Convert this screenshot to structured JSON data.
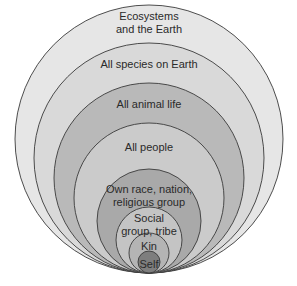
{
  "diagram": {
    "type": "nested-circles",
    "rings": [
      {
        "label_lines": [
          "Ecosystems",
          "and the Earth"
        ],
        "fill": "#e6e6e6",
        "r": 134,
        "label_y": [
          20,
          33
        ]
      },
      {
        "label_lines": [
          "All species on Earth"
        ],
        "fill": "#d9d9d9",
        "r": 115,
        "label_y": [
          68
        ]
      },
      {
        "label_lines": [
          "All animal life"
        ],
        "fill": "#b9b9b9",
        "r": 95,
        "label_y": [
          108
        ]
      },
      {
        "label_lines": [
          "All people"
        ],
        "fill": "#cbcbcb",
        "r": 75,
        "label_y": [
          151
        ]
      },
      {
        "label_lines": [
          "Own race, nation,",
          "religious group"
        ],
        "fill": "#a9a9a9",
        "r": 52,
        "label_y": [
          193,
          206
        ]
      },
      {
        "label_lines": [
          "Social",
          "group, tribe"
        ],
        "fill": "#c4c4c4",
        "r": 33,
        "label_y": [
          222,
          235
        ]
      },
      {
        "label_lines": [
          "Kin"
        ],
        "fill": "#b4b4b4",
        "r": 20,
        "label_y": [
          250
        ]
      },
      {
        "label_lines": [
          "Self"
        ],
        "fill": "#7e7e7e",
        "r": 11,
        "label_y": [
          268
        ]
      }
    ],
    "anchor": {
      "cx": 149,
      "bottom_y": 273
    },
    "stroke": "#3a3a3a"
  }
}
